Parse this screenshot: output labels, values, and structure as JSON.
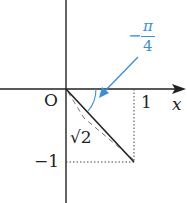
{
  "diagram": {
    "origin_label": "O",
    "x_axis_label": "x",
    "tick_x": "1",
    "tick_y": "−1",
    "hypotenuse_label": "√2",
    "angle_label": {
      "sign": "−",
      "numerator": "π",
      "denominator": "4"
    },
    "colors": {
      "axis": "#222222",
      "accent": "#3a8fd6",
      "dashed": "#777777"
    }
  }
}
